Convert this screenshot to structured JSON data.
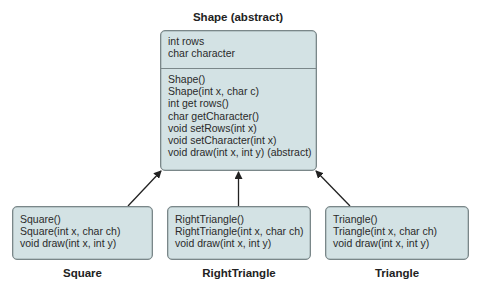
{
  "diagram": {
    "colors": {
      "box_fill": "#d3e2e4",
      "box_border": "#7a8789",
      "arrow": "#222222"
    },
    "superclass": {
      "name": "Shape (abstract)",
      "fields": [
        "int rows",
        "char character"
      ],
      "methods": [
        "Shape()",
        "Shape(int x, char c)",
        "int get rows()",
        "char getCharacter()",
        "void setRows(int x)",
        "void setCharacter(int x)",
        "void draw(int x, int y) (abstract)"
      ]
    },
    "subclasses": [
      {
        "name": "Square",
        "methods": [
          "Square()",
          "Square(int x, char ch)",
          "void draw(int x, int y)"
        ]
      },
      {
        "name": "RightTriangle",
        "methods": [
          "RightTriangle()",
          "RightTriangle(int x, char ch)",
          "void draw(int x, int y)"
        ]
      },
      {
        "name": "Triangle",
        "methods": [
          "Triangle()",
          "Triangle(int x, char ch)",
          "void draw(int x, int y)"
        ]
      }
    ],
    "relationships": [
      {
        "from": "Square",
        "to": "Shape (abstract)",
        "type": "inherits"
      },
      {
        "from": "RightTriangle",
        "to": "Shape (abstract)",
        "type": "inherits"
      },
      {
        "from": "Triangle",
        "to": "Shape (abstract)",
        "type": "inherits"
      }
    ]
  }
}
